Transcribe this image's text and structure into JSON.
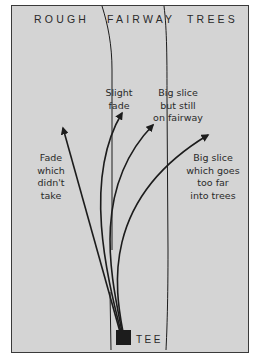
{
  "zones": {
    "rough": "ROUGH",
    "fairway": "FAIRWAY",
    "trees": "TREES"
  },
  "shots": [
    {
      "id": "fade-not-taken",
      "label": "Fade\nwhich\ndidn't\ntake"
    },
    {
      "id": "slight-fade",
      "label": "Slight\nfade"
    },
    {
      "id": "big-slice-fairway",
      "label": "Big slice\nbut still\non fairway"
    },
    {
      "id": "big-slice-trees",
      "label": "Big slice\nwhich goes\ntoo far\ninto trees"
    }
  ],
  "tee": {
    "label": "TEE"
  },
  "colors": {
    "background": "#d4d4d4",
    "ink": "#1c1c1c",
    "text": "#2a2a2a"
  }
}
